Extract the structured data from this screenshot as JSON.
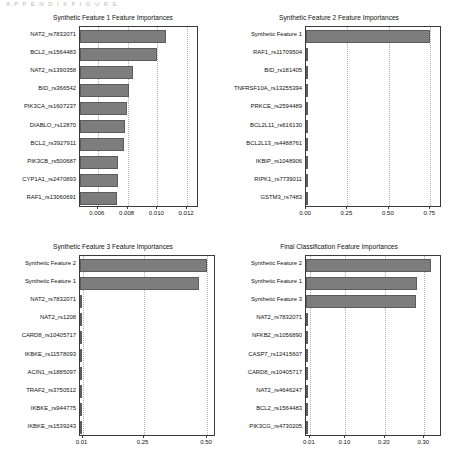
{
  "scan_artifact": "A P P E N D I X   F I G U R E",
  "chart_data": [
    {
      "id": "synthetic-feature-1",
      "type": "bar",
      "orientation": "horizontal",
      "title": "Synthetic Feature 1 Feature Importances",
      "xlabel": "",
      "ylabel": "",
      "xlim": [
        0.0048,
        0.0128
      ],
      "xticks": [
        "0.006",
        "0.008",
        "0.010",
        "0.012"
      ],
      "xtick_values": [
        0.006,
        0.008,
        0.01,
        0.012
      ],
      "grid": true,
      "categories": [
        "NAT2_rs7832071",
        "BCL2_rs1564483",
        "NAT2_rs1390358",
        "BID_rs366542",
        "PIK3CA_rs1607237",
        "DIABLO_rs12870",
        "BCL2_rs3927911",
        "PIK3CB_rs500687",
        "CYP1A1_rs2470893",
        "RAF1_rs13060691"
      ],
      "values": [
        0.01055,
        0.00995,
        0.00838,
        0.00812,
        0.00795,
        0.00782,
        0.00775,
        0.00735,
        0.00733,
        0.0073
      ]
    },
    {
      "id": "synthetic-feature-2",
      "type": "bar",
      "orientation": "horizontal",
      "title": "Synthetic Feature 2 Feature Importances",
      "xlabel": "",
      "ylabel": "",
      "xlim": [
        0.0,
        0.82
      ],
      "xticks": [
        "0.00",
        "0.25",
        "0.50",
        "0.75"
      ],
      "xtick_values": [
        0.0,
        0.25,
        0.5,
        0.75
      ],
      "grid": true,
      "categories": [
        "Synthetic Feature 1",
        "RAF1_rs11709504",
        "BID_rs181405",
        "TNFRSF10A_rs13255394",
        "PRKCE_rs2594489",
        "BCL2L11_rs616130",
        "BCL2L13_rs4488761",
        "IKBIP_rs1048906",
        "RIPK1_rs7739011",
        "GSTM3_rs7483"
      ],
      "values": [
        0.745,
        0.004,
        0.003,
        0.003,
        0.002,
        0.002,
        0.002,
        0.002,
        0.002,
        0.002
      ]
    },
    {
      "id": "synthetic-feature-3",
      "type": "bar",
      "orientation": "horizontal",
      "title": "Synthetic Feature 3 Feature Importances",
      "xlabel": "",
      "ylabel": "",
      "xlim": [
        0.0,
        0.535
      ],
      "xticks": [
        "0.01",
        "0.25",
        "0.50"
      ],
      "xtick_values": [
        0.01,
        0.25,
        0.5
      ],
      "grid": true,
      "categories": [
        "Synthetic Feature 2",
        "Synthetic Feature 1",
        "NAT2_rs7832071",
        "NAT2_rs1208",
        "CARD8_rs10405717",
        "IKBKE_rs11578093",
        "ACIN1_rs1885097",
        "TRAF2_rs3750512",
        "IKBKE_rs944775",
        "IKBKE_rs1539243"
      ],
      "values": [
        0.5,
        0.468,
        0.004,
        0.004,
        0.003,
        0.003,
        0.003,
        0.003,
        0.003,
        0.003
      ]
    },
    {
      "id": "final-classification",
      "type": "bar",
      "orientation": "horizontal",
      "title": "Final Classification Feature Importances",
      "xlabel": "",
      "ylabel": "",
      "xlim": [
        0.0,
        0.345
      ],
      "xticks": [
        "0.01",
        "0.10",
        "0.20",
        "0.30"
      ],
      "xtick_values": [
        0.01,
        0.1,
        0.2,
        0.3
      ],
      "grid": true,
      "categories": [
        "Synthetic Feature 2",
        "Synthetic Feature 1",
        "Synthetic Feature 3",
        "NAT2_rs7832071",
        "NFKB2_rs1056890",
        "CASP7_rs12415607",
        "CARD8_rs10405717",
        "NAT2_rs4646247",
        "BCL2_rs1564483",
        "PIK3CG_rs4730205"
      ],
      "values": [
        0.318,
        0.282,
        0.278,
        0.004,
        0.003,
        0.003,
        0.003,
        0.003,
        0.003,
        0.003
      ]
    }
  ],
  "colors": {
    "bar_fill": "#7d7d7d",
    "bar_edge": "#5c5c5c",
    "axes_edge": "#3a3a3a",
    "grid": "#b0b0b0",
    "text": "#111111"
  }
}
